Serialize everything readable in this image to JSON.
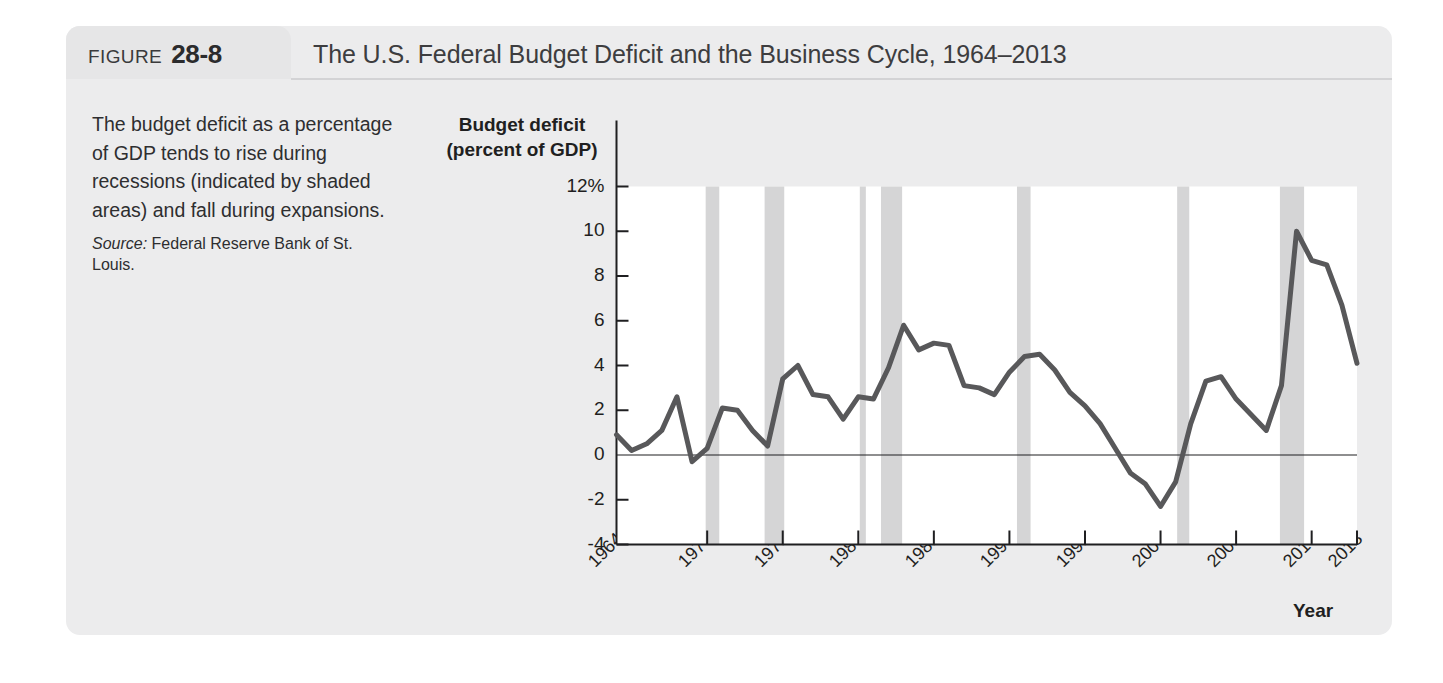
{
  "figure": {
    "label": "FIGURE",
    "number": "28-8",
    "title": "The U.S. Federal Budget Deficit and the Business Cycle, 1964–2013"
  },
  "caption": {
    "body": "The budget deficit as a percentage of GDP tends to rise during recessions (indicated by shaded areas) and fall during expansions.",
    "source_label": "Source:",
    "source_text": " Federal Reserve Bank of St. Louis."
  },
  "colors": {
    "panel_background": "#ececed",
    "tab_background": "#e6e6e7",
    "line": "#58585a",
    "recession_band": "#d5d5d6",
    "axis": "#1f1f21",
    "text": "#2e2e30"
  },
  "chart_data": {
    "type": "line",
    "title": "The U.S. Federal Budget Deficit and the Business Cycle, 1964–2013",
    "xlabel": "Year",
    "ylabel": "Budget deficit (percent of GDP)",
    "ylabel_line1": "Budget deficit",
    "ylabel_line2": "(percent of GDP)",
    "xlim": [
      1964,
      2013
    ],
    "ylim": [
      -4,
      12
    ],
    "grid": false,
    "legend": null,
    "ytick_labels": [
      "12%",
      "10",
      "8",
      "6",
      "4",
      "2",
      "0",
      "-2",
      "-4"
    ],
    "ytick_values": [
      12,
      10,
      8,
      6,
      4,
      2,
      0,
      -2,
      -4
    ],
    "xtick_labels": [
      "1964",
      "1970",
      "1975",
      "1980",
      "1985",
      "1990",
      "1995",
      "2000",
      "2005",
      "2010",
      "2013"
    ],
    "xtick_values": [
      1964,
      1970,
      1975,
      1980,
      1985,
      1990,
      1995,
      2000,
      2005,
      2010,
      2013
    ],
    "zero_line": 0,
    "series": [
      {
        "name": "Budget deficit (percent of GDP)",
        "x": [
          1964,
          1965,
          1966,
          1967,
          1968,
          1969,
          1970,
          1971,
          1972,
          1973,
          1974,
          1975,
          1976,
          1977,
          1978,
          1979,
          1980,
          1981,
          1982,
          1983,
          1984,
          1985,
          1986,
          1987,
          1988,
          1989,
          1990,
          1991,
          1992,
          1993,
          1994,
          1995,
          1996,
          1997,
          1998,
          1999,
          2000,
          2001,
          2002,
          2003,
          2004,
          2005,
          2006,
          2007,
          2008,
          2009,
          2010,
          2011,
          2012,
          2013
        ],
        "values": [
          0.9,
          0.2,
          0.5,
          1.1,
          2.6,
          -0.3,
          0.3,
          2.1,
          2.0,
          1.1,
          0.4,
          3.4,
          4.0,
          2.7,
          2.6,
          1.6,
          2.6,
          2.5,
          3.9,
          5.8,
          4.7,
          5.0,
          4.9,
          3.1,
          3.0,
          2.7,
          3.7,
          4.4,
          4.5,
          3.8,
          2.8,
          2.2,
          1.4,
          0.3,
          -0.8,
          -1.3,
          -2.3,
          -1.2,
          1.4,
          3.3,
          3.5,
          2.5,
          1.8,
          1.1,
          3.1,
          10.0,
          8.7,
          8.5,
          6.7,
          4.1
        ]
      }
    ],
    "recession_bands": [
      {
        "start": 1969.9,
        "end": 1970.8
      },
      {
        "start": 1973.8,
        "end": 1975.1
      },
      {
        "start": 1980.1,
        "end": 1980.5
      },
      {
        "start": 1981.5,
        "end": 1982.9
      },
      {
        "start": 1990.5,
        "end": 1991.4
      },
      {
        "start": 2001.1,
        "end": 2001.9
      },
      {
        "start": 2007.9,
        "end": 2009.5
      }
    ]
  }
}
